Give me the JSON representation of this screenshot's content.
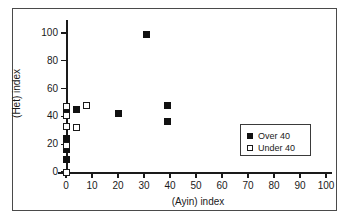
{
  "chart_data": {
    "type": "scatter",
    "title": "",
    "xlabel": "(Ayin) index",
    "ylabel": "(Het) index",
    "xlim": [
      0,
      105
    ],
    "ylim": [
      0,
      108
    ],
    "xticks": [
      0,
      10,
      20,
      30,
      40,
      50,
      60,
      70,
      80,
      90,
      100
    ],
    "yticks": [
      0,
      20,
      40,
      60,
      80,
      100
    ],
    "xtick_labels": [
      "0",
      "10",
      "20",
      "30",
      "40",
      "50",
      "60",
      "70",
      "80",
      "90",
      "100"
    ],
    "ytick_labels": [
      "0",
      "20",
      "40",
      "60",
      "80",
      "100"
    ],
    "grid": false,
    "legend_position": "lower-right-inside",
    "series": [
      {
        "name": "Over 40",
        "marker": "filled-square",
        "color": "#111111",
        "points": [
          {
            "x": 0,
            "y": 45
          },
          {
            "x": 0,
            "y": 24
          },
          {
            "x": 0,
            "y": 16
          },
          {
            "x": 0,
            "y": 9
          },
          {
            "x": 4,
            "y": 45
          },
          {
            "x": 20,
            "y": 42
          },
          {
            "x": 31,
            "y": 99
          },
          {
            "x": 39,
            "y": 48
          },
          {
            "x": 39,
            "y": 36
          }
        ]
      },
      {
        "name": "Under 40",
        "marker": "open-square",
        "color": "#ffffff",
        "points": [
          {
            "x": 0,
            "y": 47
          },
          {
            "x": 0,
            "y": 41
          },
          {
            "x": 0,
            "y": 33
          },
          {
            "x": 0,
            "y": 19
          },
          {
            "x": 0,
            "y": 0
          },
          {
            "x": 4,
            "y": 32
          },
          {
            "x": 8,
            "y": 48
          }
        ]
      }
    ]
  },
  "legend": {
    "entries": [
      {
        "label": "Over 40",
        "marker": "filled-square"
      },
      {
        "label": "Under 40",
        "marker": "open-square"
      }
    ]
  }
}
